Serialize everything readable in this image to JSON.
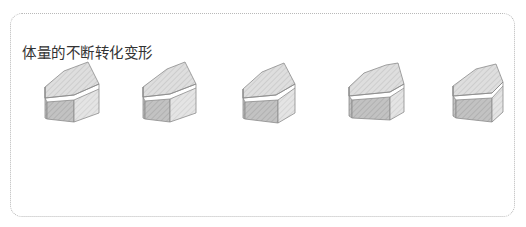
{
  "panel": {
    "title": "体量的不断转化变形"
  },
  "colors": {
    "border": "#b9b9b9",
    "stroke": "#8c8c8c",
    "top_face": "#dcdcdc",
    "front_face": "#bdbdbd",
    "side_face": "#d6d6d6",
    "stripe": "#c6c6c6"
  },
  "shapes": [
    {
      "label": "block-variation-1",
      "left": 44
    },
    {
      "label": "block-variation-2",
      "left": 142
    },
    {
      "label": "block-variation-3",
      "left": 242
    },
    {
      "label": "block-variation-4",
      "left": 348
    },
    {
      "label": "block-variation-5",
      "left": 452
    }
  ]
}
